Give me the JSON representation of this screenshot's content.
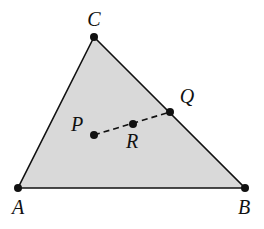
{
  "diagram": {
    "type": "triangle",
    "fill_color": "#d9d9d9",
    "stroke_color": "#111111",
    "vertices": [
      "A",
      "B",
      "C"
    ],
    "points": {
      "A": {
        "label": "A"
      },
      "B": {
        "label": "B"
      },
      "C": {
        "label": "C"
      },
      "P": {
        "label": "P",
        "location": "interior"
      },
      "Q": {
        "label": "Q",
        "location": "on side BC"
      },
      "R": {
        "label": "R",
        "location": "on segment PQ"
      }
    },
    "segments": [
      {
        "from": "A",
        "to": "B",
        "style": "solid"
      },
      {
        "from": "B",
        "to": "C",
        "style": "solid"
      },
      {
        "from": "C",
        "to": "A",
        "style": "solid"
      },
      {
        "from": "P",
        "to": "Q",
        "style": "dashed"
      }
    ]
  }
}
